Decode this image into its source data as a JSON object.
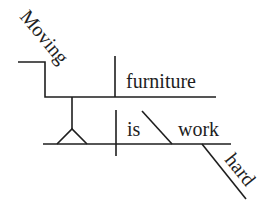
{
  "diagram": {
    "type": "Reed-Kellogg sentence diagram",
    "sentence": "Moving furniture is work hard",
    "words": {
      "gerund": "Moving",
      "gerund_object": "furniture",
      "verb": "is",
      "predicate_complement": "work",
      "modifier": "hard"
    },
    "colors": {
      "ink": "#1e1e1e",
      "background": "#ffffff"
    }
  }
}
